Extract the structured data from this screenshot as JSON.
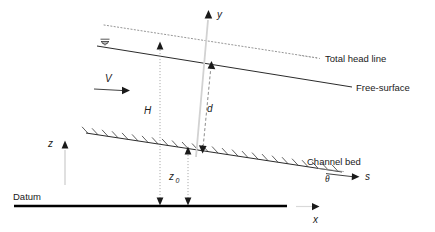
{
  "figure": {
    "title_alt": "Definition sketch of open channel flow",
    "labels": {
      "total_head_line": "Total head line",
      "free_surface": "Free-surface",
      "channel_bed": "Channel bed",
      "datum": "Datum"
    },
    "variables": {
      "y_axis": "y",
      "x_axis": "x",
      "z_axis": "z",
      "s_axis": "s",
      "velocity": "V",
      "total_head": "H",
      "flow_depth": "d",
      "bed_elevation": "z",
      "bed_elevation_sub": "0",
      "bed_slope_angle": "θ"
    },
    "colors": {
      "line": "#1a1a1a",
      "datum": "#000000",
      "faint": "#b9b9b9",
      "background": "#ffffff"
    }
  }
}
